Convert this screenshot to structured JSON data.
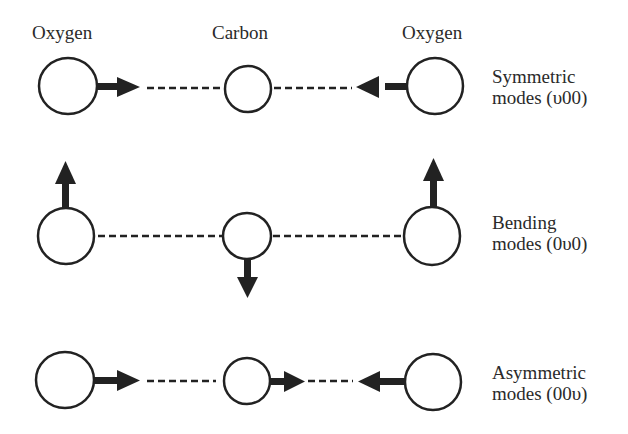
{
  "header": {
    "atoms": [
      {
        "label": "Oxygen"
      },
      {
        "label": "Carbon"
      },
      {
        "label": "Oxygen"
      }
    ]
  },
  "modes": [
    {
      "name": "symmetric",
      "title": "Symmetric",
      "notation": "modes (υ00)",
      "motion": {
        "left_oxygen": "right",
        "carbon": "none",
        "right_oxygen": "left"
      }
    },
    {
      "name": "bending",
      "title": "Bending",
      "notation": "modes (0υ0)",
      "motion": {
        "left_oxygen": "up",
        "carbon": "down",
        "right_oxygen": "up"
      }
    },
    {
      "name": "asymmetric",
      "title": "Asymmetric",
      "notation": "modes (00υ)",
      "motion": {
        "left_oxygen": "right",
        "carbon": "right",
        "right_oxygen": "left"
      }
    }
  ],
  "colors": {
    "ink": "#222222",
    "background": "#ffffff"
  }
}
